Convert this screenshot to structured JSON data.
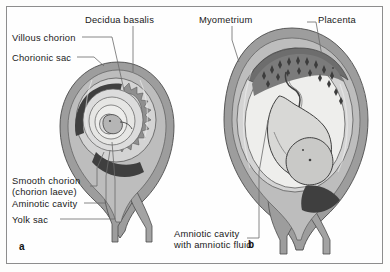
{
  "figure": {
    "background_color": "#fefefe",
    "frame_color": "#8d8d8d",
    "panels": [
      {
        "letter": "a",
        "description": "early embryo in chorionic sac within uterus"
      },
      {
        "letter": "b",
        "description": "fetus in amniotic cavity with developed placenta"
      }
    ]
  },
  "labels": {
    "decidua_basalis": "Decidua basalis",
    "myometrium": "Myometrium",
    "placenta": "Placenta",
    "villous_chorion": "Villous chorion",
    "chorionic_sac": "Chorionic sac",
    "smooth_chorion_line1": "Smooth chorion",
    "smooth_chorion_line2": "(chorion laeve)",
    "amniotic_cavity_a": "Aminotic cavity",
    "yolk_sac": "Yolk sac",
    "amniotic_cavity_b_line1": "Amniotic cavity",
    "amniotic_cavity_b_line2": "with amniotic fluid"
  },
  "panel_letters": {
    "a": "a",
    "b": "b"
  },
  "colors": {
    "myometrium_gray": "#9a9a9a",
    "decidua_mid_gray": "#b9b9b9",
    "chorion_light": "#d2d2d2",
    "cavity_pale": "#e8e8e6",
    "dark_blood": "#4a4a4a",
    "villous_gray": "#8c8c8c",
    "outline": "#4d4d4d",
    "leader_line": "#6b6b6b",
    "text": "#1a1a1a"
  }
}
